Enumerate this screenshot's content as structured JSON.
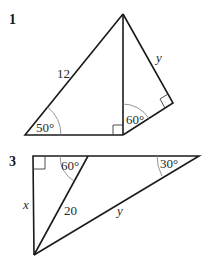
{
  "diagrams": [
    {
      "number": "1",
      "labels": {
        "hypotenuse": "12",
        "angle_bottom_left": "50°",
        "angle_foot": "60°",
        "side_y": "y"
      },
      "right_angles": [
        "foot of perpendicular",
        "right vertex"
      ]
    },
    {
      "number": "3",
      "labels": {
        "angle_top_inner": "60°",
        "angle_top_right": "30°",
        "side_x": "x",
        "segment": "20",
        "side_y": "y"
      },
      "right_angles": [
        "top-left corner"
      ]
    }
  ]
}
